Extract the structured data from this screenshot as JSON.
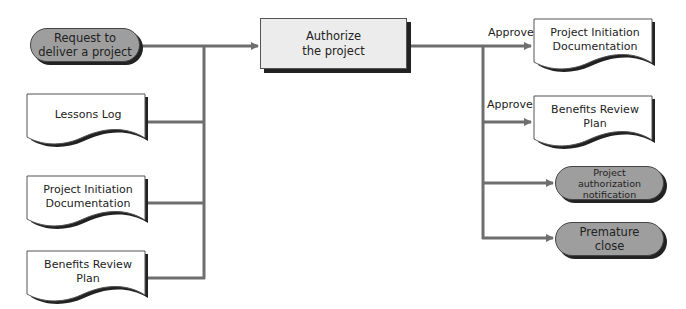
{
  "diagram": {
    "inputs": {
      "trigger": {
        "label": "Request to\ndeliver a project"
      },
      "documents": [
        {
          "label": "Lessons Log"
        },
        {
          "label": "Project Initiation\nDocumentation"
        },
        {
          "label": "Benefits Review\nPlan"
        }
      ]
    },
    "process": {
      "label": "Authorize\nthe project"
    },
    "outputs": {
      "documents": [
        {
          "label": "Project Initiation\nDocumentation",
          "edge_label": "Approve"
        },
        {
          "label": "Benefits Review\nPlan",
          "edge_label": "Approve"
        }
      ],
      "events": [
        {
          "label": "Project\nauthorization\nnotification"
        },
        {
          "label": "Premature\nclose"
        }
      ]
    },
    "colors": {
      "connector": "#6e6e6e",
      "event_fill": "#9e9e9e",
      "process_fill": "#ececec",
      "shadow": "#222222"
    }
  }
}
